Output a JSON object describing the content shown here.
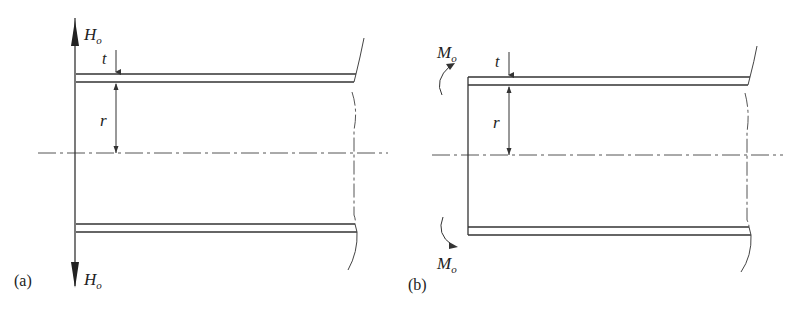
{
  "figure": {
    "panels": [
      {
        "id": "a",
        "caption": "(a)",
        "load_type": "radial shear force",
        "labels": {
          "force_top": "H",
          "force_top_sub": "o",
          "force_bottom": "H",
          "force_bottom_sub": "o",
          "thickness": "t",
          "radius": "r"
        }
      },
      {
        "id": "b",
        "caption": "(b)",
        "load_type": "edge bending moment",
        "labels": {
          "moment_top": "M",
          "moment_top_sub": "o",
          "moment_bottom": "M",
          "moment_bottom_sub": "o",
          "thickness": "t",
          "radius": "r"
        }
      }
    ],
    "colors": {
      "line": "#333333",
      "centerline": "#555555",
      "background": "#ffffff"
    }
  }
}
